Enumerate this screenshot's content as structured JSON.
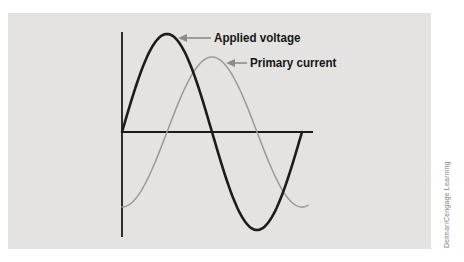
{
  "figure": {
    "panel_color": "#e4e3e1",
    "page_background": "#ffffff"
  },
  "chart_data": {
    "type": "line",
    "title": "",
    "xlabel": "",
    "ylabel": "",
    "x_unit": "degrees",
    "x_range_deg": [
      0,
      360
    ],
    "grid": false,
    "ticks": false,
    "legend_position": "inline-annotations",
    "axes": {
      "axis_color": "#1a1a1a",
      "axis_stroke_px": 1.8
    },
    "series": [
      {
        "name": "Applied voltage",
        "waveform": "sine",
        "amplitude_rel": 1.0,
        "phase_deg": 0,
        "cycles": 1.0,
        "color": "#1c1c1c",
        "stroke_px": 2.6
      },
      {
        "name": "Primary current",
        "waveform": "sine",
        "amplitude_rel": 0.77,
        "phase_deg": -90,
        "cycles": 1.03,
        "color": "#9a9a98",
        "stroke_px": 1.5
      }
    ],
    "annotations": [
      {
        "label_name": "applied-voltage-label",
        "text": "Applied voltage",
        "arrow_color": "#8c8c8a",
        "arrow_tip": [
          178,
          38
        ],
        "arrow_tail": [
          211,
          38
        ],
        "text_pos": [
          214,
          31
        ]
      },
      {
        "label_name": "primary-current-label",
        "text": "Primary current",
        "arrow_color": "#8c8c8a",
        "arrow_tip": [
          226,
          63
        ],
        "arrow_tail": [
          247,
          63
        ],
        "text_pos": [
          250,
          56
        ]
      }
    ],
    "layout_px": {
      "origin": [
        122,
        132
      ],
      "period_px": 180,
      "amp_applied_px": 98,
      "amp_primary_px": 75,
      "x_axis_end": 313,
      "y_axis_top": 32,
      "y_axis_bottom": 237,
      "applied_x_end": 302,
      "primary_x_end": 308
    }
  },
  "credit": {
    "text": "Delmar/Cengage Learning",
    "color": "#808080"
  }
}
